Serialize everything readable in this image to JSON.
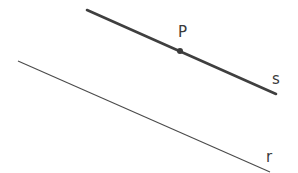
{
  "diagram": {
    "lines": [
      {
        "id": "s",
        "label": "s",
        "x1": 87,
        "y1": 10,
        "x2": 276,
        "y2": 94,
        "stroke_width": 2.6,
        "color": "#3f3f3f"
      },
      {
        "id": "r",
        "label": "r",
        "x1": 18,
        "y1": 61,
        "x2": 270,
        "y2": 172,
        "stroke_width": 1.1,
        "color": "#4a4a4a"
      }
    ],
    "points": [
      {
        "id": "P",
        "label": "P",
        "x": 180,
        "y": 51,
        "on_line": "s"
      }
    ],
    "labels": {
      "P": "P",
      "s": "s",
      "r": "r"
    }
  }
}
